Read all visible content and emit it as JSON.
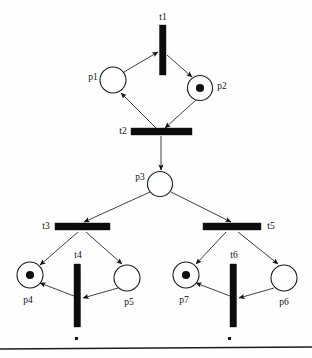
{
  "diagram": {
    "kind": "petri-net",
    "title": "",
    "colors": {
      "background": "#fefefe",
      "stroke": "#1a1a1a",
      "transition_fill": "#0d0d0d",
      "token_fill": "#111111",
      "arc": "#2a2a2a"
    },
    "places": [
      {
        "id": "p1",
        "label": "p1",
        "cx": 113,
        "cy": 80,
        "r": 13,
        "tokens": 0,
        "label_x": 93,
        "label_y": 80,
        "label_anchor": "middle"
      },
      {
        "id": "p2",
        "label": "p2",
        "cx": 200,
        "cy": 88,
        "r": 12.5,
        "tokens": 1,
        "label_x": 222,
        "label_y": 89,
        "label_anchor": "middle"
      },
      {
        "id": "p3",
        "label": "p3",
        "cx": 160,
        "cy": 184,
        "r": 12.5,
        "tokens": 0,
        "label_x": 140,
        "label_y": 180,
        "label_anchor": "middle"
      },
      {
        "id": "p4",
        "label": "p4",
        "cx": 30,
        "cy": 275,
        "r": 13,
        "tokens": 1,
        "label_x": 28,
        "label_y": 303,
        "label_anchor": "middle"
      },
      {
        "id": "p5",
        "label": "p5",
        "cx": 127,
        "cy": 278,
        "r": 13,
        "tokens": 0,
        "label_x": 129,
        "label_y": 305,
        "label_anchor": "middle"
      },
      {
        "id": "p6",
        "label": "p6",
        "cx": 284,
        "cy": 278,
        "r": 13,
        "tokens": 0,
        "label_x": 284,
        "label_y": 305,
        "label_anchor": "middle"
      },
      {
        "id": "p7",
        "label": "p7",
        "cx": 186,
        "cy": 275,
        "r": 13,
        "tokens": 1,
        "label_x": 184,
        "label_y": 303,
        "label_anchor": "middle"
      }
    ],
    "transitions": [
      {
        "id": "t1",
        "label": "t1",
        "orientation": "vertical",
        "x": 159.5,
        "y": 25,
        "w": 6.5,
        "h": 50,
        "label_x": 163,
        "label_y": 20,
        "label_anchor": "middle"
      },
      {
        "id": "t2",
        "label": "t2",
        "orientation": "horizontal",
        "x": 131,
        "y": 128,
        "w": 61,
        "h": 7,
        "label_x": 123,
        "label_y": 134,
        "label_anchor": "middle"
      },
      {
        "id": "t3",
        "label": "t3",
        "orientation": "horizontal",
        "x": 55,
        "y": 223,
        "w": 55,
        "h": 7,
        "label_x": 46,
        "label_y": 229,
        "label_anchor": "middle"
      },
      {
        "id": "t4",
        "label": "t4",
        "orientation": "vertical",
        "x": 74,
        "y": 264,
        "w": 6.5,
        "h": 63,
        "label_x": 78,
        "label_y": 258,
        "label_anchor": "middle"
      },
      {
        "id": "t5",
        "label": "t5",
        "orientation": "horizontal",
        "x": 203,
        "y": 223,
        "w": 58,
        "h": 7,
        "label_x": 271,
        "label_y": 229,
        "label_anchor": "middle"
      },
      {
        "id": "t6",
        "label": "t6",
        "orientation": "vertical",
        "x": 230,
        "y": 264,
        "w": 6.5,
        "h": 63,
        "label_x": 234,
        "label_y": 258,
        "label_anchor": "middle"
      }
    ],
    "arcs": [
      {
        "id": "arc-p1-t1",
        "from": "p1",
        "to": "t1",
        "x1": 124,
        "y1": 72,
        "x2": 158,
        "y2": 52
      },
      {
        "id": "arc-t1-p2",
        "from": "t1",
        "to": "p2",
        "x1": 167,
        "y1": 55,
        "x2": 192,
        "y2": 77
      },
      {
        "id": "arc-p2-t2",
        "from": "p2",
        "to": "t2",
        "x1": 196,
        "y1": 100,
        "x2": 165,
        "y2": 128
      },
      {
        "id": "arc-t2-p1",
        "from": "t2",
        "to": "p1",
        "x1": 156,
        "y1": 128,
        "x2": 121,
        "y2": 93
      },
      {
        "id": "arc-t2-p3",
        "from": "t2",
        "to": "p3",
        "x1": 161,
        "y1": 136,
        "x2": 161,
        "y2": 170
      },
      {
        "id": "arc-p3-t3",
        "from": "p3",
        "to": "t3",
        "x1": 150,
        "y1": 192,
        "x2": 84,
        "y2": 222
      },
      {
        "id": "arc-p3-t5",
        "from": "p3",
        "to": "t5",
        "x1": 171,
        "y1": 192,
        "x2": 231,
        "y2": 222
      },
      {
        "id": "arc-t3-p4",
        "from": "t3",
        "to": "p4",
        "x1": 78,
        "y1": 232,
        "x2": 40,
        "y2": 265
      },
      {
        "id": "arc-t3-p5",
        "from": "t3",
        "to": "p5",
        "x1": 86,
        "y1": 232,
        "x2": 122,
        "y2": 264
      },
      {
        "id": "arc-p5-t4",
        "from": "p5",
        "to": "t4",
        "x1": 118,
        "y1": 288,
        "x2": 83,
        "y2": 298
      },
      {
        "id": "arc-t4-p4",
        "from": "t4",
        "to": "p4",
        "x1": 74,
        "y1": 296,
        "x2": 40,
        "y2": 283
      },
      {
        "id": "arc-t5-p7",
        "from": "t5",
        "to": "p7",
        "x1": 226,
        "y1": 232,
        "x2": 196,
        "y2": 264
      },
      {
        "id": "arc-t5-p6",
        "from": "t5",
        "to": "p6",
        "x1": 238,
        "y1": 232,
        "x2": 278,
        "y2": 264
      },
      {
        "id": "arc-p6-t6",
        "from": "p6",
        "to": "t6",
        "x1": 274,
        "y1": 288,
        "x2": 239,
        "y2": 298
      },
      {
        "id": "arc-t6-p7",
        "from": "t6",
        "to": "p7",
        "x1": 230,
        "y1": 296,
        "x2": 196,
        "y2": 283
      }
    ],
    "baseline_rule": {
      "x1": 0,
      "y1": 349,
      "x2": 312,
      "y2": 347
    },
    "specks": [
      {
        "x": 75,
        "y": 337,
        "w": 3,
        "h": 3
      },
      {
        "x": 228,
        "y": 337,
        "w": 3,
        "h": 3
      }
    ]
  }
}
